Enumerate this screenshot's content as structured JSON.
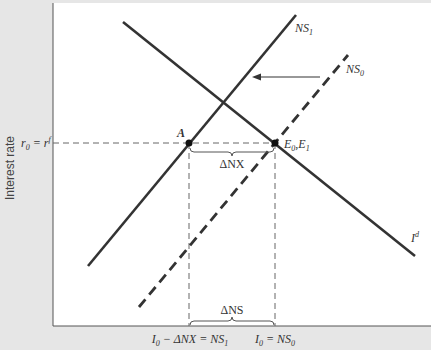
{
  "diagram": {
    "type": "economics-supply-demand",
    "colors": {
      "background": "#e6e6e6",
      "plot_area": "#ffffff",
      "lines": "#333333",
      "guides": "#666666"
    },
    "y_axis": {
      "title": "Interest rate",
      "tick_label": {
        "main": "r",
        "sub": "0",
        "eq": " = r",
        "sup": "f"
      }
    },
    "x_axis": {
      "tick_labels": [
        {
          "id": "left",
          "base": "I",
          "sub": "0",
          "rest": " − ΔNX = NS",
          "sub2": "1"
        },
        {
          "id": "right",
          "base": "I",
          "sub": "0",
          "rest": " = NS",
          "sub2": "0"
        }
      ]
    },
    "curves": [
      {
        "id": "Id",
        "label_base": "I",
        "label_sup": "d",
        "style": "solid"
      },
      {
        "id": "NS1",
        "label_base": "NS",
        "label_sub": "1",
        "style": "solid"
      },
      {
        "id": "NS0",
        "label_base": "NS",
        "label_sub": "0",
        "style": "dashed"
      }
    ],
    "points": [
      {
        "id": "A",
        "label": "A"
      },
      {
        "id": "E",
        "label_base1": "E",
        "label_sub1": "0",
        "sep": ",",
        "label_base2": "E",
        "label_sub2": "1"
      }
    ],
    "braces": [
      {
        "id": "delta-nx",
        "label": "ΔNX"
      },
      {
        "id": "delta-ns",
        "label": "ΔNS"
      }
    ],
    "arrow": {
      "direction": "left",
      "meaning": "shift NS0 to NS1"
    }
  }
}
